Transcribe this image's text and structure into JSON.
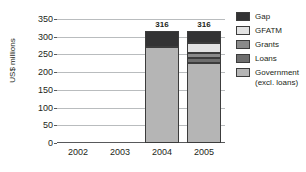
{
  "chart_data": {
    "type": "bar",
    "title": "",
    "subtitle": "",
    "xlabel": "",
    "ylabel": "US$ millions",
    "ylim": [
      0,
      350
    ],
    "ytick_step": 50,
    "yticks": [
      350,
      300,
      250,
      200,
      150,
      100,
      50,
      0
    ],
    "grid": true,
    "stacked": true,
    "legend_position": "right",
    "categories": [
      "2002",
      "2003",
      "2004",
      "2005"
    ],
    "series": [
      {
        "name": "Gap",
        "color": "#333334",
        "values": [
          null,
          null,
          46,
          33
        ]
      },
      {
        "name": "GFATM",
        "color": "#e3e3e3",
        "values": [
          null,
          null,
          0,
          28
        ]
      },
      {
        "name": "Grants",
        "color": "#8a8a8a",
        "values": [
          null,
          null,
          0,
          15
        ]
      },
      {
        "name": "Loans",
        "color": "#6e6e6e",
        "values": [
          null,
          null,
          0,
          15
        ]
      },
      {
        "name": "Government (excl. loans)",
        "color": "#b5b5b5",
        "values": [
          null,
          null,
          270,
          225
        ]
      }
    ],
    "totals": [
      null,
      null,
      316,
      316
    ],
    "bar_labels": [
      "",
      "",
      "316",
      "316"
    ]
  },
  "legend": {
    "items": [
      {
        "label": "Gap"
      },
      {
        "label": "GFATM"
      },
      {
        "label": "Grants"
      },
      {
        "label": "Loans"
      },
      {
        "label": "Government\n(excl. loans)"
      }
    ]
  },
  "axis": {
    "y_title": "US$ millions",
    "y_tick_labels": [
      "350",
      "300",
      "250",
      "200",
      "150",
      "100",
      "50",
      "0"
    ],
    "x_tick_labels": [
      "2002",
      "2003",
      "2004",
      "2005"
    ]
  },
  "colors": {
    "gap": "#333334",
    "gfatm": "#e3e3e3",
    "grants": "#8a8a8a",
    "loans": "#6e6e6e",
    "government": "#b5b5b5",
    "grid": "#b9bcbe",
    "axis": "#58595b",
    "text": "#231f20"
  }
}
